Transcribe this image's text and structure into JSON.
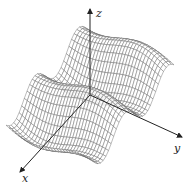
{
  "figure": {
    "type": "3d-surface-wireframe",
    "axes": {
      "x": {
        "label": "x"
      },
      "y": {
        "label": "y"
      },
      "z": {
        "label": "z"
      }
    },
    "colors": {
      "mesh_line": "#6a6a6a",
      "axis": "#222222",
      "background": "#ffffff"
    }
  }
}
